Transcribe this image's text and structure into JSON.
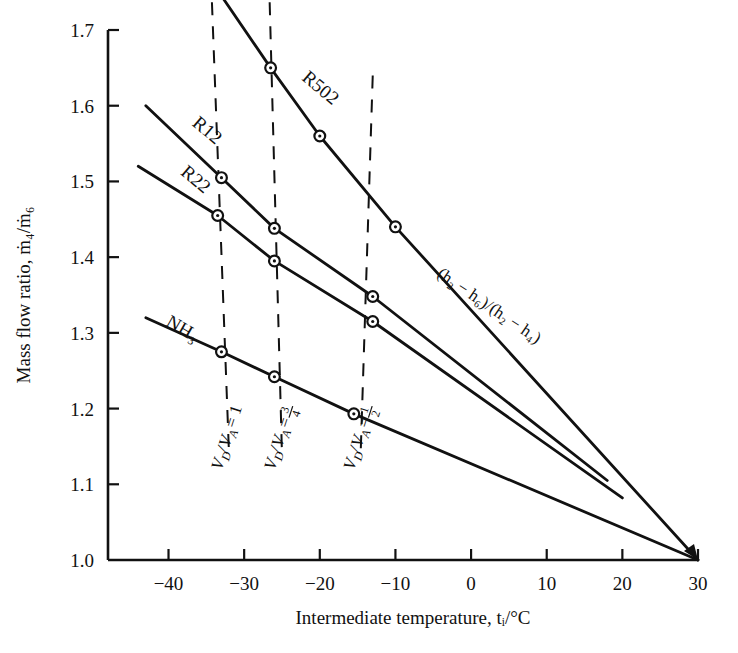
{
  "chart_data": {
    "type": "line",
    "title": "",
    "xlabel": "Intermediate temperature, tᵢ/°C",
    "ylabel": "Mass flow ratio, ṁ₄/ṁ₆",
    "xlim": [
      -48,
      30
    ],
    "ylim": [
      1.0,
      1.7
    ],
    "xticks": [
      -40,
      -30,
      -20,
      -10,
      0,
      10,
      20,
      30
    ],
    "xticklabels": [
      "−40",
      "−30",
      "−20",
      "−10",
      "0",
      "10",
      "20",
      "30"
    ],
    "yticks": [
      1.0,
      1.1,
      1.2,
      1.3,
      1.4,
      1.5,
      1.6,
      1.7
    ],
    "yticklabels": [
      "1.0",
      "1.1",
      "1.2",
      "1.3",
      "1.4",
      "1.5",
      "1.6",
      "1.7"
    ],
    "grid": false,
    "legend": "inline-curve-labels",
    "convergence_point": {
      "x": 30,
      "y": 1.0
    },
    "series": [
      {
        "name": "R502",
        "label": "R502",
        "label_pos": {
          "x": -22.5,
          "y": 1.635
        },
        "label_rotation": 40,
        "points": [
          {
            "x": -33.0,
            "y": 1.745
          },
          {
            "x": -26.5,
            "y": 1.65
          },
          {
            "x": -20.0,
            "y": 1.56
          },
          {
            "x": -10.0,
            "y": 1.44
          },
          {
            "x": 30.0,
            "y": 1.0
          }
        ],
        "markers": [
          {
            "x": -26.5,
            "y": 1.65,
            "vd_va": "1"
          },
          {
            "x": -20.0,
            "y": 1.56,
            "vd_va": "3/4"
          },
          {
            "x": -10.0,
            "y": 1.44,
            "vd_va": "1/2"
          }
        ]
      },
      {
        "name": "R12",
        "label": "R12",
        "label_pos": {
          "x": -37.0,
          "y": 1.575
        },
        "label_rotation": 40,
        "points": [
          {
            "x": -43.0,
            "y": 1.6
          },
          {
            "x": -33.0,
            "y": 1.505
          },
          {
            "x": -26.0,
            "y": 1.438
          },
          {
            "x": -13.0,
            "y": 1.348
          },
          {
            "x": 18.0,
            "y": 1.105
          }
        ],
        "markers": [
          {
            "x": -33.0,
            "y": 1.505,
            "vd_va": "1"
          },
          {
            "x": -26.0,
            "y": 1.438,
            "vd_va": "3/4"
          },
          {
            "x": -13.0,
            "y": 1.348,
            "vd_va": "1/2"
          }
        ]
      },
      {
        "name": "R22",
        "label": "R22",
        "label_pos": {
          "x": -38.5,
          "y": 1.51
        },
        "label_rotation": 40,
        "points": [
          {
            "x": -44.0,
            "y": 1.52
          },
          {
            "x": -33.5,
            "y": 1.455
          },
          {
            "x": -26.0,
            "y": 1.395
          },
          {
            "x": -13.0,
            "y": 1.315
          },
          {
            "x": 20.0,
            "y": 1.082
          }
        ],
        "markers": [
          {
            "x": -33.5,
            "y": 1.455,
            "vd_va": "1"
          },
          {
            "x": -26.0,
            "y": 1.395,
            "vd_va": "3/4"
          },
          {
            "x": -13.0,
            "y": 1.315,
            "vd_va": "1/2"
          }
        ]
      },
      {
        "name": "NH3",
        "label": "NH₃",
        "label_pos": {
          "x": -40.5,
          "y": 1.31
        },
        "label_rotation": 30,
        "points": [
          {
            "x": -43.0,
            "y": 1.32
          },
          {
            "x": -33.0,
            "y": 1.275
          },
          {
            "x": -26.0,
            "y": 1.242
          },
          {
            "x": -15.5,
            "y": 1.193
          },
          {
            "x": 30.0,
            "y": 1.0
          }
        ],
        "markers": [
          {
            "x": -33.0,
            "y": 1.275,
            "vd_va": "1"
          },
          {
            "x": -26.0,
            "y": 1.242,
            "vd_va": "3/4"
          },
          {
            "x": -15.5,
            "y": 1.193,
            "vd_va": "1/2"
          }
        ]
      }
    ],
    "dashed_lines": [
      {
        "label": "V_D/V_A = 1",
        "numerator": "",
        "value_text": "1",
        "from": {
          "x": -34.5,
          "y": 1.8
        },
        "to": {
          "x": -32.0,
          "y": 1.14
        },
        "label_pos": {
          "x": -33.0,
          "y": 1.118
        },
        "label_rotation": 72
      },
      {
        "label": "V_D/V_A = 3/4",
        "value_text": "3/4",
        "numerator": "3",
        "denominator": "4",
        "from": {
          "x": -26.8,
          "y": 1.8
        },
        "to": {
          "x": -25.0,
          "y": 1.14
        },
        "label_pos": {
          "x": -26.0,
          "y": 1.118
        },
        "label_rotation": 72
      },
      {
        "label": "V_D/V_A = 1/2",
        "value_text": "1/2",
        "numerator": "1",
        "denominator": "2",
        "from": {
          "x": -13.0,
          "y": 1.64
        },
        "to": {
          "x": -14.6,
          "y": 1.14
        },
        "label_pos": {
          "x": -15.5,
          "y": 1.118
        },
        "label_rotation": 72
      }
    ],
    "annotations": [
      {
        "name": "enthalpy-ratio-annotation",
        "text": "(h₂ − h₆)/(h₂ − h₄)",
        "pos": {
          "x": 2.0,
          "y": 1.33
        },
        "rotation": 34
      },
      {
        "name": "top-clipped-vdva-label",
        "text": "Vᴅ/Vᴀ",
        "pos": {
          "x": -20.5,
          "y": 1.755
        },
        "rotation": 0
      }
    ]
  },
  "axes": {
    "x_axis_title": "Intermediate temperature, tᵢ/°C",
    "y_axis_title": "Mass flow ratio, ṁ₄/ṁ₆"
  },
  "labels": {
    "vd_symbol": "V",
    "vd_sub": "D",
    "slash": "/",
    "va_symbol": "V",
    "va_sub": "A",
    "equals": "="
  }
}
